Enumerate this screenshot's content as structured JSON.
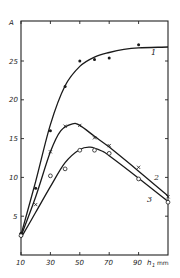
{
  "chart_data": {
    "type": "line",
    "title": "",
    "xlabel": "h₁ mm",
    "ylabel": "A",
    "xlim": [
      10,
      110
    ],
    "ylim": [
      0,
      28
    ],
    "x_ticks": [
      10,
      30,
      50,
      70,
      90
    ],
    "y_ticks": [
      5,
      10,
      15,
      20,
      25
    ],
    "grid": false,
    "legend": "curves labeled inline 1, 2, 3",
    "series": [
      {
        "name": "1",
        "marker": "filled-dot",
        "points": [
          [
            10,
            2.8
          ],
          [
            20,
            8.6
          ],
          [
            30,
            16.0
          ],
          [
            40,
            21.7
          ],
          [
            50,
            25.0
          ],
          [
            60,
            25.2
          ],
          [
            70,
            25.4
          ],
          [
            90,
            27.1
          ]
        ],
        "fit": [
          [
            10,
            2.6
          ],
          [
            20,
            9.5
          ],
          [
            30,
            16.8
          ],
          [
            40,
            21.8
          ],
          [
            50,
            24.3
          ],
          [
            60,
            25.5
          ],
          [
            70,
            26.1
          ],
          [
            80,
            26.5
          ],
          [
            90,
            26.7
          ],
          [
            110,
            26.8
          ]
        ]
      },
      {
        "name": "2",
        "marker": "cross",
        "points": [
          [
            10,
            2.6
          ],
          [
            20,
            6.5
          ],
          [
            30,
            13.3
          ],
          [
            40,
            16.6
          ],
          [
            50,
            16.7
          ],
          [
            60,
            15.1
          ],
          [
            70,
            14.1
          ],
          [
            90,
            11.3
          ],
          [
            110,
            7.5
          ]
        ],
        "fit": [
          [
            10,
            2.4
          ],
          [
            20,
            7.5
          ],
          [
            30,
            13.3
          ],
          [
            37,
            16.0
          ],
          [
            45,
            16.9
          ],
          [
            50,
            16.7
          ],
          [
            60,
            15.3
          ],
          [
            70,
            13.9
          ],
          [
            90,
            10.8
          ],
          [
            110,
            7.6
          ]
        ]
      },
      {
        "name": "3",
        "marker": "open-circle",
        "points": [
          [
            10,
            2.5
          ],
          [
            30,
            10.2
          ],
          [
            40,
            11.1
          ],
          [
            50,
            13.5
          ],
          [
            60,
            13.5
          ],
          [
            70,
            13.1
          ],
          [
            90,
            9.8
          ],
          [
            110,
            6.8
          ]
        ],
        "fit": [
          [
            10,
            2.2
          ],
          [
            20,
            5.5
          ],
          [
            30,
            8.8
          ],
          [
            40,
            11.9
          ],
          [
            50,
            13.6
          ],
          [
            57,
            13.9
          ],
          [
            65,
            13.4
          ],
          [
            70,
            12.8
          ],
          [
            90,
            9.9
          ],
          [
            110,
            6.9
          ]
        ]
      }
    ]
  },
  "axis": {
    "y_label": "A",
    "x_label_main": "h",
    "x_label_sub": "1",
    "x_label_unit": "mm",
    "x_tick_labels": [
      "10",
      "30",
      "50",
      "70",
      "90"
    ],
    "y_tick_labels": [
      "5",
      "10",
      "15",
      "20",
      "25"
    ]
  },
  "curve_labels": [
    "1",
    "2",
    "3"
  ]
}
